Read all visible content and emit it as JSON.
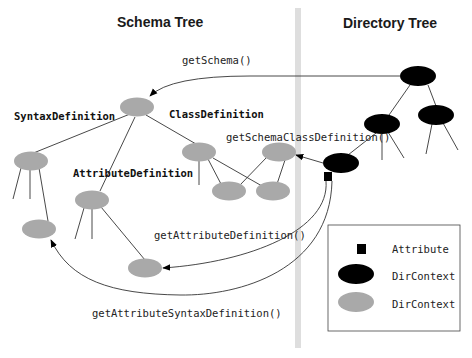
{
  "titles": {
    "schema_tree": "Schema Tree",
    "directory_tree": "Directory Tree"
  },
  "methods": {
    "get_schema": "getSchema()",
    "get_schema_class_definition": "getSchemaClassDefinition()",
    "get_attribute_definition": "getAttributeDefinition()",
    "get_attribute_syntax_definition": "getAttributeSyntaxDefinition()"
  },
  "node_labels": {
    "syntax_definition": "SyntaxDefinition",
    "class_definition": "ClassDefinition",
    "attribute_definition": "AttributeDefinition"
  },
  "legend": {
    "items": [
      {
        "shape": "square",
        "color": "#000000",
        "label": "Attribute"
      },
      {
        "shape": "ellipse",
        "color": "#000000",
        "label": "DirContext"
      },
      {
        "shape": "ellipse",
        "color": "#a9a9a9",
        "label": "DirContext"
      }
    ]
  },
  "colors": {
    "schema_node": "#a9a9a9",
    "directory_node": "#000000",
    "divider": "#dcdcdc"
  }
}
